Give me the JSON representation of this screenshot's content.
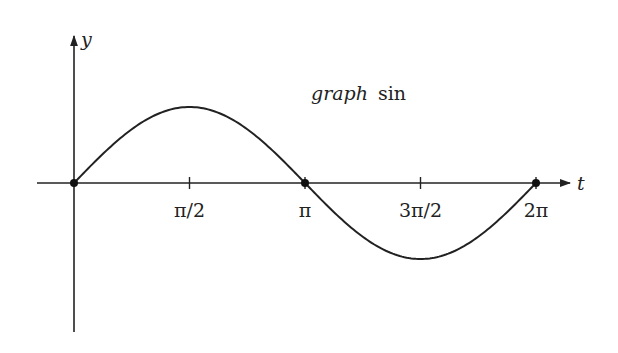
{
  "chart_data": {
    "type": "line",
    "title": "graph sin",
    "title_parts": {
      "italic": "graph",
      "roman": "sin"
    },
    "xlabel": "t",
    "ylabel": "y",
    "x_ticks": [
      {
        "value": 1.5708,
        "label": "π/2"
      },
      {
        "value": 3.1416,
        "label": "π"
      },
      {
        "value": 4.7124,
        "label": "3π/2"
      },
      {
        "value": 6.2832,
        "label": "2π"
      }
    ],
    "xlim": [
      -0.32,
      7.0
    ],
    "ylim": [
      -1.95,
      1.95
    ],
    "grid": false,
    "legend": null,
    "marked_points": [
      {
        "x": 0,
        "y": 0
      },
      {
        "x": 3.1416,
        "y": 0
      },
      {
        "x": 6.2832,
        "y": 0
      }
    ],
    "series": [
      {
        "name": "sin(t)",
        "function": "sin",
        "x": [
          0,
          0.7854,
          1.5708,
          2.3562,
          3.1416,
          3.927,
          4.7124,
          5.4978,
          6.2832
        ],
        "values": [
          0,
          0.7071,
          1,
          0.7071,
          0,
          -0.7071,
          -1,
          -0.7071,
          0
        ]
      }
    ],
    "colors": {
      "curve": "#222222",
      "axes": "#222222",
      "background": "#ffffff"
    }
  }
}
